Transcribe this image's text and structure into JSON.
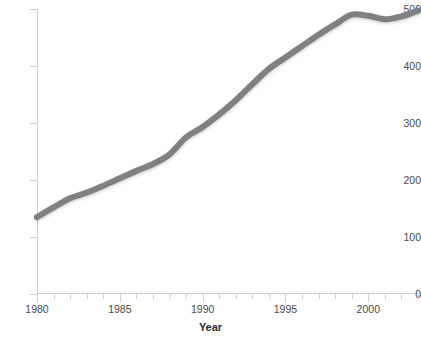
{
  "chart_data": {
    "type": "line",
    "title": "",
    "xlabel": "Year",
    "ylabel": "",
    "xlim": [
      1980,
      2003
    ],
    "ylim": [
      0,
      500
    ],
    "grid": false,
    "legend": null,
    "line_color": "#808080",
    "line_width": 6,
    "x_ticks_major": [
      1980,
      1985,
      1990,
      1995,
      2000
    ],
    "x_tick_labels": [
      "1980",
      "1985",
      "1990",
      "1995",
      "2000"
    ],
    "x_ticks_minor_step": 1,
    "y_ticks": [
      0,
      100,
      200,
      300,
      400,
      500
    ],
    "y_tick_labels": [
      "0",
      "100",
      "200",
      "300",
      "400",
      "500"
    ],
    "x": [
      1980,
      1981,
      1982,
      1983,
      1984,
      1985,
      1986,
      1987,
      1988,
      1989,
      1990,
      1991,
      1992,
      1993,
      1994,
      1995,
      1996,
      1997,
      1998,
      1999,
      2000,
      2001,
      2002,
      2003
    ],
    "values": [
      135,
      152,
      168,
      178,
      190,
      203,
      216,
      228,
      245,
      275,
      293,
      315,
      340,
      368,
      395,
      415,
      435,
      455,
      473,
      490,
      488,
      482,
      487,
      497
    ],
    "series": [
      {
        "name": "series-1",
        "color": "#808080",
        "values": [
          135,
          152,
          168,
          178,
          190,
          203,
          216,
          228,
          245,
          275,
          293,
          315,
          340,
          368,
          395,
          415,
          435,
          455,
          473,
          490,
          488,
          482,
          487,
          497
        ]
      }
    ]
  },
  "axis": {
    "x_title": "Year"
  },
  "title_text": ""
}
